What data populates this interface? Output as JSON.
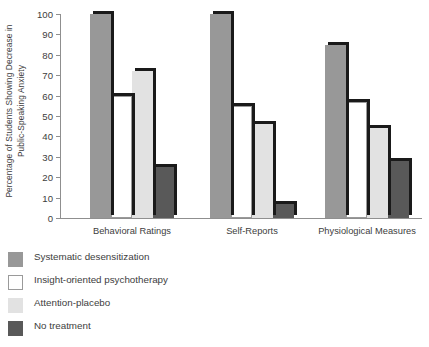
{
  "chart_data": {
    "type": "bar",
    "title": "",
    "xlabel": "",
    "ylabel": "Percentage of Students Showing Decrease in Public-Speaking Anxiety",
    "ylabel_line1": "Percentage of Students Showing Decrease in",
    "ylabel_line2": "Public-Speaking Anxiety",
    "ylim": [
      0,
      100
    ],
    "ytick_step": 10,
    "yticks": [
      0,
      10,
      20,
      30,
      40,
      50,
      60,
      70,
      80,
      90,
      100
    ],
    "ytick_labels": [
      "0",
      "10",
      "20",
      "30",
      "40",
      "50",
      "60",
      "70",
      "80",
      "90",
      "100"
    ],
    "grid": false,
    "legend_position": "below-left",
    "categories": [
      "Behavioral Ratings",
      "Self-Reports",
      "Physiological Measures"
    ],
    "series": [
      {
        "name": "Systematic desensitization",
        "color": "#989898",
        "values": [
          100,
          100,
          85
        ]
      },
      {
        "name": "Insight-oriented psychotherapy",
        "color": "#ffffff",
        "values": [
          60,
          55,
          57
        ]
      },
      {
        "name": "Attention-placebo",
        "color": "#e2e2e2",
        "values": [
          72,
          46,
          44
        ]
      },
      {
        "name": "No treatment",
        "color": "#595959",
        "values": [
          25,
          7,
          28
        ]
      }
    ]
  },
  "legend": {
    "items": [
      {
        "label": "Systematic desensitization",
        "swatch": "legend-swatch-systematic-desensitization"
      },
      {
        "label": "Insight-oriented psychotherapy",
        "swatch": "legend-swatch-insight-oriented-psychotherapy"
      },
      {
        "label": "Attention-placebo",
        "swatch": "legend-swatch-attention-placebo"
      },
      {
        "label": "No treatment",
        "swatch": "legend-swatch-no-treatment"
      }
    ]
  }
}
